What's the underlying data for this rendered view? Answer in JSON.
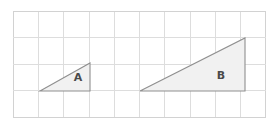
{
  "figure": {
    "background_color": "#ffffff",
    "width": 279,
    "height": 125,
    "grid": {
      "line_color": "#dddddd",
      "outer_line_color": "#d2d2d2",
      "x_start": 13,
      "x_end": 266,
      "y_start": 11,
      "y_end": 117,
      "columns": 10,
      "rows": 4,
      "cell_width": 25.3,
      "cell_height": 26.5,
      "x_positions": [
        13,
        38.3,
        63.6,
        88.9,
        114.2,
        139.5,
        164.8,
        190.1,
        215.4,
        240.7,
        266
      ],
      "y_positions": [
        11,
        37.5,
        64,
        90.5,
        117
      ]
    },
    "shapes": [
      {
        "label": "A",
        "kind": "right-triangle",
        "fill": "#f1f1f1",
        "stroke": "#8f8f8f",
        "points": "40,91 90,63 90,91",
        "vertices": [
          {
            "x": 40,
            "y": 91
          },
          {
            "x": 90,
            "y": 63
          },
          {
            "x": 90,
            "y": 91
          }
        ],
        "base_cells": 2,
        "height_cells": 1,
        "label_x": 78,
        "label_y": 78
      },
      {
        "label": "B",
        "kind": "right-triangle",
        "fill": "#f1f1f1",
        "stroke": "#8f8f8f",
        "points": "140,91 245,38 245,91",
        "vertices": [
          {
            "x": 140,
            "y": 91
          },
          {
            "x": 245,
            "y": 38
          },
          {
            "x": 245,
            "y": 91
          }
        ],
        "base_cells": 4,
        "height_cells": 2,
        "label_x": 221,
        "label_y": 76
      }
    ]
  }
}
